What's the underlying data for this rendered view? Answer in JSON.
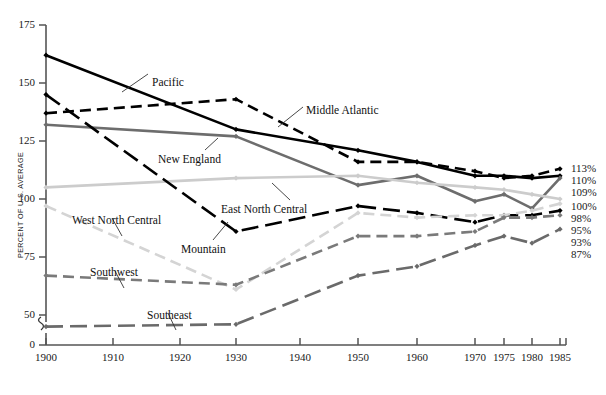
{
  "chart_data": {
    "type": "line",
    "title": "",
    "subtitle": "",
    "xlabel": "",
    "ylabel": "PERCENT OF U.S. AVERAGE",
    "x": [
      1900,
      1910,
      1920,
      1930,
      1940,
      1950,
      1960,
      1970,
      1975,
      1980,
      1985
    ],
    "xticklabels": [
      "1900",
      "1910",
      "1920",
      "1930",
      "1940",
      "1950",
      "1960",
      "1970",
      "1975",
      "1980",
      "1985"
    ],
    "yticks": [
      0,
      50,
      75,
      100,
      125,
      150,
      175
    ],
    "yticklabels": [
      "0",
      "50",
      "75",
      "100",
      "125",
      "150",
      "175"
    ],
    "ylim": [
      40,
      175
    ],
    "axis_break": true,
    "axis_break_note": "y-axis broken between 0 and 50",
    "grid": false,
    "legend": "inline-labels-with-leader-lines",
    "series": [
      {
        "name": "Pacific",
        "color": "#000000",
        "dash": "solid",
        "width": 2.6,
        "x": [
          1900,
          1930,
          1950,
          1960,
          1970,
          1975,
          1980,
          1985
        ],
        "values": [
          162,
          130,
          121,
          116,
          110,
          110,
          109,
          110
        ],
        "end_label": "110%"
      },
      {
        "name": "Middle Atlantic",
        "color": "#000000",
        "dash": "dashed",
        "width": 2.6,
        "x": [
          1900,
          1930,
          1950,
          1960,
          1970,
          1975,
          1980,
          1985
        ],
        "values": [
          137,
          143,
          116,
          116,
          112,
          109,
          110,
          113
        ],
        "end_label": "113%"
      },
      {
        "name": "New England",
        "color": "#6d6d6d",
        "dash": "solid",
        "width": 2.6,
        "x": [
          1900,
          1930,
          1950,
          1960,
          1970,
          1975,
          1980,
          1985
        ],
        "values": [
          132,
          127,
          106,
          110,
          99,
          102,
          96,
          109
        ],
        "end_label": "109%"
      },
      {
        "name": "East North Central",
        "color": "#cccccc",
        "dash": "solid",
        "width": 2.6,
        "x": [
          1900,
          1930,
          1950,
          1960,
          1970,
          1975,
          1980,
          1985
        ],
        "values": [
          105,
          109,
          110,
          107,
          105,
          104,
          102,
          100
        ],
        "end_label": "100%"
      },
      {
        "name": "Mountain",
        "color": "#000000",
        "dash": "longdash",
        "width": 2.6,
        "x": [
          1900,
          1930,
          1950,
          1960,
          1970,
          1975,
          1980,
          1985
        ],
        "values": [
          145,
          86,
          97,
          94,
          90,
          93,
          93,
          95
        ],
        "end_label": "95%"
      },
      {
        "name": "West North Central",
        "color": "#d4d4d4",
        "dash": "dashed",
        "width": 2.6,
        "x": [
          1900,
          1930,
          1950,
          1960,
          1970,
          1975,
          1980,
          1985
        ],
        "values": [
          97,
          61,
          94,
          92,
          93,
          93,
          95,
          98
        ],
        "end_label": "98%"
      },
      {
        "name": "Southwest",
        "color": "#7a7a7a",
        "dash": "dashed",
        "width": 2.6,
        "x": [
          1900,
          1930,
          1950,
          1960,
          1970,
          1975,
          1980,
          1985
        ],
        "values": [
          67,
          63,
          84,
          84,
          86,
          92,
          92,
          93
        ],
        "end_label": "93%"
      },
      {
        "name": "Southeast",
        "color": "#6a6a6a",
        "dash": "longdash",
        "width": 2.6,
        "x": [
          1900,
          1930,
          1950,
          1960,
          1970,
          1975,
          1980,
          1985
        ],
        "values": [
          45,
          46,
          67,
          71,
          80,
          84,
          81,
          87
        ],
        "end_label": "87%"
      }
    ],
    "end_labels": [
      "113%",
      "110%",
      "109%",
      "100%",
      "98%",
      "95%",
      "93%",
      "87%"
    ],
    "annotations": [
      {
        "text": "Pacific",
        "x": 152,
        "y": 76
      },
      {
        "text": "Middle Atlantic",
        "x": 306,
        "y": 104
      },
      {
        "text": "New England",
        "x": 158,
        "y": 153
      },
      {
        "text": "East North Central",
        "x": 221,
        "y": 203
      },
      {
        "text": "Mountain",
        "x": 181,
        "y": 243
      },
      {
        "text": "West North Central",
        "x": 72,
        "y": 214
      },
      {
        "text": "Southwest",
        "x": 90,
        "y": 266
      },
      {
        "text": "Southeast",
        "x": 147,
        "y": 309
      }
    ]
  }
}
